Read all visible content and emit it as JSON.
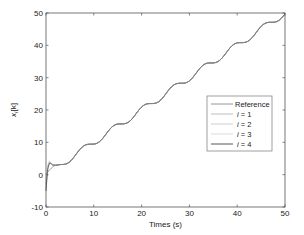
{
  "chart_data": {
    "type": "line",
    "title": "",
    "xlabel": "Times (s)",
    "ylabel": "x_i[k]",
    "ylabel_parts": {
      "base": "x",
      "sub": "i",
      "suffix": "[k]"
    },
    "xlim": [
      0,
      50
    ],
    "ylim": [
      -10,
      50
    ],
    "xticks": [
      0,
      10,
      20,
      30,
      40,
      50
    ],
    "yticks": [
      -10,
      0,
      10,
      20,
      30,
      40,
      50
    ],
    "xtick_labels": [
      "0",
      "10",
      "20",
      "30",
      "40",
      "50"
    ],
    "ytick_labels": [
      "-10",
      "0",
      "10",
      "20",
      "30",
      "40",
      "50"
    ],
    "grid": false,
    "legend_position": "center-right",
    "reference_formula": "x = t + sin(t)",
    "series": [
      {
        "name": "Reference",
        "color": "#8a8a8a",
        "x": [
          0,
          1,
          2,
          3.14,
          4,
          5,
          6,
          7,
          8,
          9.42,
          11,
          12,
          13,
          14,
          15.71,
          17,
          18,
          19,
          20,
          21.99,
          23,
          24,
          25,
          26,
          28.27,
          30,
          31,
          32,
          33,
          34.56,
          36,
          37,
          38,
          39,
          40.84,
          42,
          43,
          44,
          45,
          47.12,
          48,
          49,
          50
        ],
        "y": [
          0,
          1.84,
          2.91,
          3.14,
          3.24,
          4.04,
          5.72,
          7.66,
          8.99,
          9.42,
          10.0,
          11.46,
          13.42,
          14.99,
          15.71,
          16.04,
          17.25,
          19.15,
          20.91,
          21.99,
          22.15,
          23.09,
          24.87,
          26.76,
          28.27,
          29.01,
          30.6,
          32.55,
          34.0,
          34.56,
          35.0,
          36.36,
          38.3,
          39.96,
          40.84,
          41.08,
          42.17,
          44.02,
          45.85,
          47.12,
          47.23,
          48.05,
          49.74
        ]
      },
      {
        "name": "i = 1",
        "color": "#b5b5b5",
        "x": [
          0,
          0.2,
          0.4,
          0.7,
          1.0,
          1.4,
          2.0,
          3.14
        ],
        "y": [
          -3.0,
          0.5,
          2.8,
          4.0,
          3.6,
          3.0,
          2.9,
          3.14
        ]
      },
      {
        "name": "i = 2",
        "color": "#c8c8c8",
        "x": [
          0,
          0.2,
          0.4,
          0.7,
          1.0,
          1.4,
          2.0,
          3.14
        ],
        "y": [
          -4.0,
          0.0,
          2.5,
          3.8,
          3.4,
          3.0,
          2.9,
          3.14
        ]
      },
      {
        "name": "i = 3",
        "color": "#d6d6d6",
        "x": [
          0,
          0.2,
          0.4,
          0.7,
          1.0,
          1.4,
          2.0,
          3.14
        ],
        "y": [
          -2.0,
          1.0,
          3.0,
          4.3,
          3.7,
          3.1,
          2.9,
          3.14
        ]
      },
      {
        "name": "i = 4",
        "color": "#444444",
        "x": [
          0,
          0.2,
          0.4,
          0.7,
          1.0,
          1.4,
          2.0,
          3.14
        ],
        "y": [
          -5.0,
          -1.0,
          2.0,
          3.5,
          3.5,
          3.0,
          2.9,
          3.14
        ]
      }
    ]
  }
}
